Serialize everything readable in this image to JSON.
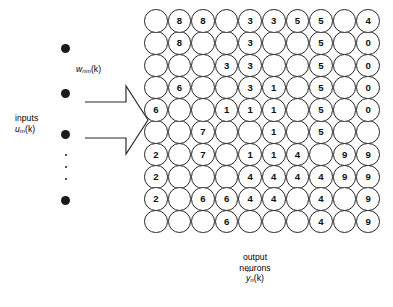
{
  "figure": {
    "background_color": "#ffffff",
    "stroke_color": "#262626"
  },
  "inputs": {
    "label_line1": "inputs",
    "label_line2_var": "u",
    "label_line2_sub": "m",
    "label_line2_arg": "(k)",
    "dot_count": 4,
    "ellipsis_dot_count": 3,
    "dot_color": "#1a1a1a"
  },
  "weights": {
    "var": "w",
    "sub": "nm",
    "arg": "(k)"
  },
  "arrow": {
    "name": "block-arrow",
    "direction": "right",
    "fill": "none",
    "stroke": "#262626"
  },
  "output": {
    "label_line1": "output",
    "label_line2": "neurons",
    "hat": "^",
    "var": "y",
    "sub": "n",
    "arg": "(k)"
  },
  "chart_data": {
    "type": "heatmap",
    "rows": 10,
    "cols": 10,
    "cell_shape": "circle",
    "blank_marker": "",
    "values": [
      [
        "",
        "8",
        "8",
        "",
        "3",
        "3",
        "5",
        "5",
        "",
        "4"
      ],
      [
        "",
        "8",
        "",
        "",
        "3",
        "",
        "",
        "5",
        "",
        "0"
      ],
      [
        "",
        "",
        "",
        "3",
        "3",
        "",
        "",
        "5",
        "",
        "0"
      ],
      [
        "",
        "6",
        "",
        "",
        "3",
        "1",
        "",
        "5",
        "",
        "0"
      ],
      [
        "6",
        "",
        "",
        "1",
        "1",
        "1",
        "",
        "5",
        "",
        "0"
      ],
      [
        "",
        "",
        "7",
        "",
        "",
        "1",
        "",
        "5",
        "",
        ""
      ],
      [
        "2",
        "",
        "7",
        "",
        "1",
        "1",
        "4",
        "",
        "9",
        "9"
      ],
      [
        "2",
        "",
        "",
        "",
        "4",
        "4",
        "4",
        "4",
        "9",
        "9"
      ],
      [
        "2",
        "",
        "6",
        "6",
        "4",
        "4",
        "",
        "4",
        "",
        "9"
      ],
      [
        "",
        "",
        "",
        "6",
        "",
        "",
        "",
        "4",
        "",
        "9"
      ]
    ]
  }
}
